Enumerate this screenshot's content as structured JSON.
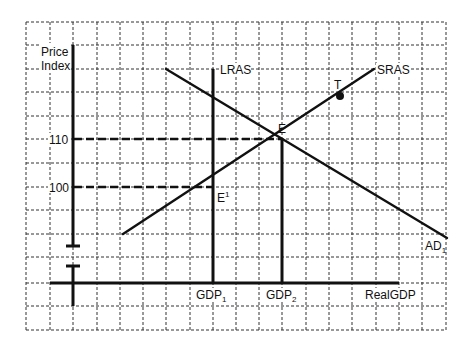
{
  "diagram": {
    "type": "economics-AS-AD",
    "y_axis": {
      "label_line1": "Price",
      "label_line2": "Index",
      "ticks": [
        {
          "label": "110",
          "y": 139
        },
        {
          "label": "100",
          "y": 187
        }
      ],
      "has_axis_break": true
    },
    "x_axis": {
      "label": "RealGDP",
      "ticks": [
        {
          "label": "GDP",
          "sub": "1",
          "x": 213
        },
        {
          "label": "GDP",
          "sub": "2",
          "x": 282
        }
      ]
    },
    "curves": {
      "lras": {
        "label": "LRAS",
        "x": 213,
        "y_top": 69
      },
      "sras": {
        "label": "SRAS",
        "from": [
          123,
          234
        ],
        "to": [
          374,
          69
        ]
      },
      "ad": {
        "label": "AD",
        "sub": "1",
        "from": [
          166,
          69
        ],
        "to": [
          447,
          238
        ]
      }
    },
    "points": {
      "e": {
        "label": "E",
        "x": 282,
        "y": 139
      },
      "e1": {
        "label": "E",
        "sup": "1",
        "x": 213,
        "y": 187
      },
      "t": {
        "label": "T",
        "x": 340,
        "y": 96
      }
    },
    "colors": {
      "line": "#111111",
      "grid": "#333333",
      "background": "#ffffff"
    }
  }
}
